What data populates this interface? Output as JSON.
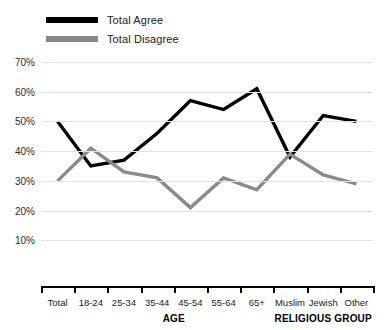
{
  "legend": {
    "position": "top-left",
    "items": [
      {
        "label": "Total Agree",
        "color": "#000000",
        "key": "agree"
      },
      {
        "label": "Total Disagree",
        "color": "#8a8a8a",
        "key": "disagree"
      }
    ]
  },
  "axis": {
    "y_ticks": [
      "70%",
      "60%",
      "50%",
      "40%",
      "30%",
      "20%",
      "10%"
    ],
    "group_labels": [
      {
        "text": "AGE",
        "center_category": "35-44"
      },
      {
        "text": "RELIGIOUS GROUP",
        "center_category": "Jewish"
      }
    ]
  },
  "chart_data": {
    "type": "line",
    "title": "",
    "xlabel": "",
    "ylabel": "",
    "ylim": [
      0,
      70
    ],
    "ytick_values": [
      10,
      20,
      30,
      40,
      50,
      60,
      70
    ],
    "grid": true,
    "legend_position": "top-left",
    "categories": [
      "Total",
      "18-24",
      "25-34",
      "35-44",
      "45-54",
      "55-64",
      "65+",
      "Muslim",
      "Jewish",
      "Other"
    ],
    "series": [
      {
        "name": "Total Agree",
        "color": "#000000",
        "values": [
          50,
          35,
          37,
          46,
          57,
          54,
          61,
          38,
          52,
          50
        ]
      },
      {
        "name": "Total Disagree",
        "color": "#8a8a8a",
        "values": [
          30,
          41,
          33,
          31,
          21,
          31,
          27,
          39,
          32,
          29
        ]
      }
    ],
    "annotations": [
      {
        "text": "AGE",
        "span": [
          "18-24",
          "65+"
        ]
      },
      {
        "text": "RELIGIOUS GROUP",
        "span": [
          "Muslim",
          "Other"
        ]
      }
    ]
  }
}
